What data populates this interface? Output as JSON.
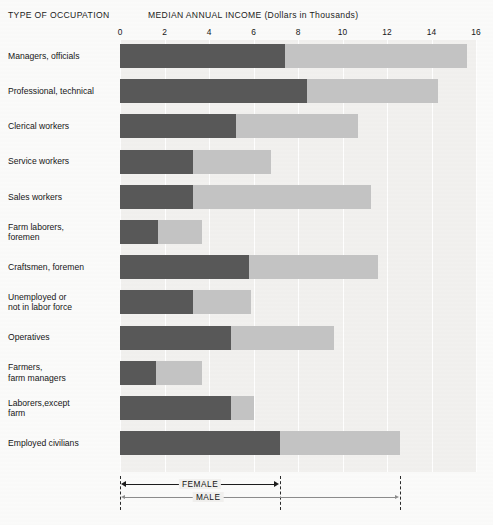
{
  "header": {
    "left_title": "TYPE OF OCCUPATION",
    "right_title": "MEDIAN ANNUAL INCOME (Dollars in Thousands)"
  },
  "legend": {
    "female_label": "FEMALE",
    "male_label": "MALE",
    "female_color": "#585858",
    "male_color": "#c3c3c3",
    "female_range": [
      0,
      7.2
    ],
    "male_range": [
      0,
      12.6
    ]
  },
  "chart_data": {
    "type": "bar",
    "orientation": "horizontal",
    "layout": "overlapping",
    "title": "MEDIAN ANNUAL INCOME (Dollars in Thousands)",
    "xlabel": "MEDIAN ANNUAL INCOME (Dollars in Thousands)",
    "ylabel": "TYPE OF OCCUPATION",
    "xlim": [
      0,
      16
    ],
    "xticks": [
      0,
      2,
      4,
      6,
      8,
      10,
      12,
      14,
      16
    ],
    "xtick_labels": [
      "0",
      "2",
      "4",
      "6",
      "8",
      "10",
      "12",
      "14",
      "16"
    ],
    "grid": "vertical",
    "legend_position": "bottom",
    "categories": [
      "Managers, officials",
      "Professional, technical",
      "Clerical workers",
      "Service workers",
      "Sales workers",
      "Farm laborers,\nforemen",
      "Craftsmen, foremen",
      "Unemployed or\nnot in labor force",
      "Operatives",
      "Farmers,\nfarm managers",
      "Laborers,except\nfarm",
      "Employed civilians"
    ],
    "series": [
      {
        "name": "FEMALE",
        "color": "#585858",
        "values": [
          7.4,
          8.4,
          5.2,
          3.3,
          3.3,
          1.7,
          5.8,
          3.3,
          5.0,
          1.6,
          5.0,
          7.2
        ]
      },
      {
        "name": "MALE",
        "color": "#c3c3c3",
        "values": [
          15.6,
          14.3,
          10.7,
          6.8,
          11.3,
          3.7,
          11.6,
          5.9,
          9.6,
          3.7,
          6.0,
          12.6
        ]
      }
    ]
  }
}
